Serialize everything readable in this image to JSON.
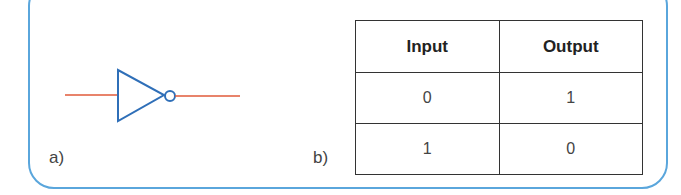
{
  "diagram": {
    "type": "NOT gate with truth table",
    "frame_color": "#5aa6dc",
    "gate": {
      "name": "NOT gate",
      "symbol_color": "#2f6fb8",
      "wire_color": "#e05a3a"
    },
    "labels": {
      "a": "a)",
      "b": "b)"
    },
    "truth_table": {
      "headers": [
        "Input",
        "Output"
      ],
      "rows": [
        [
          "0",
          "1"
        ],
        [
          "1",
          "0"
        ]
      ]
    }
  }
}
